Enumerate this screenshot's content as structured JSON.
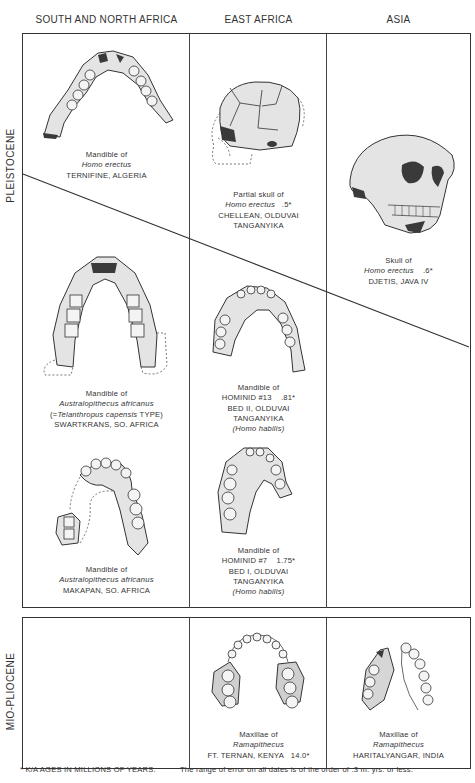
{
  "columns": [
    "SOUTH AND NORTH AFRICA",
    "EAST AFRICA",
    "ASIA"
  ],
  "epochs": [
    "PLEISTOCENE",
    "MIO-PLIOCENE"
  ],
  "specimens": {
    "ternifine": {
      "lines": [
        "Mandible of",
        "Homo erectus",
        "TERNIFINE, ALGERIA"
      ],
      "italic": [
        1
      ]
    },
    "chellean": {
      "l1": "Partial skull of",
      "l2": "Homo erectus",
      "age": ".5*",
      "l3": "CHELLEAN, OLDUVAI",
      "l4": "TANGANYIKA"
    },
    "djetis": {
      "l1": "Skull of",
      "l2": "Homo erectus",
      "age": ".6*",
      "l3": "DJETIS, JAVA IV"
    },
    "swartkrans": {
      "l1": "Mandible of",
      "l2": "Australopithecus africanus",
      "l3a": "(=",
      "l3b": "Telanthropus capensis",
      "l3c": " TYPE)",
      "l4": "SWARTKRANS, SO. AFRICA"
    },
    "hominid13": {
      "l1": "Mandible of",
      "l2": "HOMINID #13",
      "age": ".81*",
      "l3": "BED II, OLDUVAI",
      "l4": "TANGANYIKA",
      "l5": "(Homo habilis)"
    },
    "makapan": {
      "l1": "Mandible of",
      "l2": "Australopithecus africanus",
      "l3": "MAKAPAN, SO. AFRICA"
    },
    "hominid7": {
      "l1": "Mandible of",
      "l2": "HOMINID #7",
      "age": "1.75*",
      "l3": "BED I, OLDUVAI",
      "l4": "TANGANYIKA",
      "l5": "(Homo habilis)"
    },
    "ftternan": {
      "l1": "Maxillae of",
      "l2": "Ramapithecus",
      "l3": "FT. TERNAN, KENYA",
      "age": "14.0*"
    },
    "haritalyangar": {
      "l1": "Maxillae of",
      "l2": "Ramapithecus",
      "l3": "HARITALYANGAR, INDIA"
    }
  },
  "footnotes": {
    "ages": "* K/A AGES IN MILLIONS OF YEARS.",
    "error": "The range of error on all dates is of the order of .3 m. yrs. or less."
  }
}
